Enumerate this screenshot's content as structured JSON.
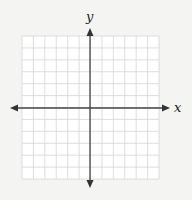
{
  "diagram": {
    "type": "coordinate-plane",
    "x_label": "x",
    "y_label": "y",
    "grid": {
      "cells_x": 12,
      "cells_y": 12,
      "color": "#d8d8d8"
    },
    "axis_color": "#444444",
    "background": "#f4f4f2",
    "grid_background": "#ffffff"
  }
}
